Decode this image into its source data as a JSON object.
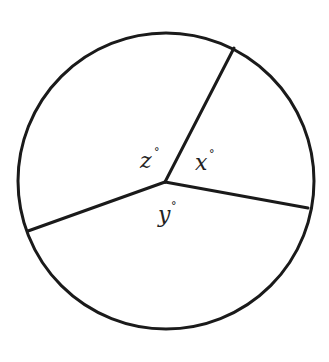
{
  "diagram": {
    "type": "circle-with-three-radial-segments",
    "circle": {
      "cx": 166,
      "cy": 181,
      "r": 148
    },
    "vertex": {
      "x": 165,
      "y": 182
    },
    "segments": [
      {
        "name": "segment-upper-right",
        "x2": 234,
        "y2": 48
      },
      {
        "name": "segment-right",
        "x2": 308,
        "y2": 208
      },
      {
        "name": "segment-left",
        "x2": 28,
        "y2": 231
      }
    ],
    "stroke_color": "#1a1a1a",
    "labels": [
      {
        "name": "angle-z",
        "var": "z",
        "deg": "°",
        "x": 140,
        "y": 168,
        "dx": 14,
        "dy": -12
      },
      {
        "name": "angle-x",
        "var": "x",
        "deg": "°",
        "x": 195,
        "y": 170,
        "dx": 14,
        "dy": -12
      },
      {
        "name": "angle-y",
        "var": "y",
        "deg": "°",
        "x": 158,
        "y": 222,
        "dx": 13,
        "dy": -12
      }
    ]
  }
}
